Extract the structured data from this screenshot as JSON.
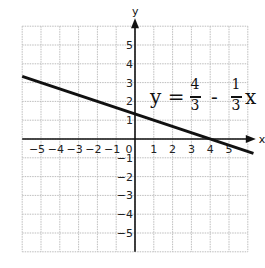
{
  "chart_data": {
    "type": "line",
    "title": "",
    "equation": {
      "lhs": "y =",
      "term1_num": "4",
      "term1_den": "3",
      "op": "-",
      "term2_num": "1",
      "term2_den": "3",
      "var": "x"
    },
    "xlabel": "x",
    "ylabel": "y",
    "xlim": [
      -6,
      6
    ],
    "ylim": [
      -6,
      6
    ],
    "grid": true,
    "x_ticks": [
      "-5",
      "-4",
      "-3",
      "-2",
      "-1",
      "0",
      "1",
      "2",
      "3",
      "4",
      "5"
    ],
    "y_ticks": [
      "5",
      "4",
      "3",
      "2",
      "1",
      "-1",
      "-2",
      "-3",
      "-4",
      "-5"
    ],
    "series": [
      {
        "name": "y = 4/3 - 1/3 x",
        "slope": -0.3333,
        "intercept": 1.3333,
        "x": [
          -6,
          6.3
        ],
        "y": [
          3.333,
          -0.767
        ],
        "color": "#111111"
      }
    ],
    "legend": "none"
  }
}
